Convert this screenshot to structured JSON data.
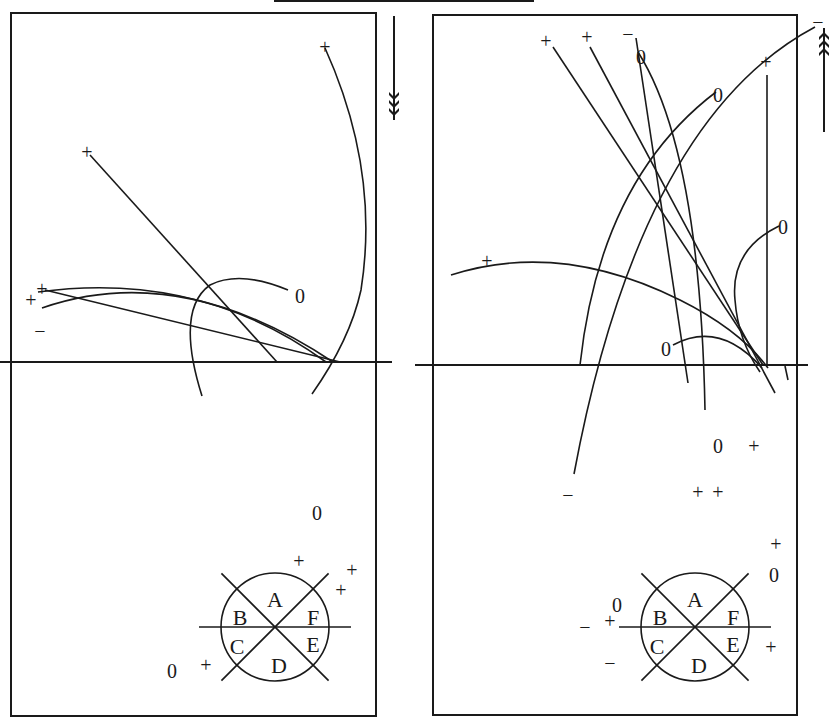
{
  "diagram": {
    "stroke_color": "#1a1a1a",
    "background": "#ffffff",
    "top_bar": {
      "x1": 274,
      "x2": 534,
      "y": 1
    },
    "panels": [
      {
        "id": "left",
        "frame": {
          "x": 11,
          "y": 13,
          "w": 365,
          "h": 703
        },
        "baseline": {
          "x1": 0,
          "x2": 392,
          "y": 362
        },
        "direction_arrow": {
          "x": 394,
          "y1": 16,
          "y2": 120,
          "direction": "down"
        },
        "traces": [
          {
            "d": "M 325 48 Q 380 170 361 290 Q 350 340 312 394"
          },
          {
            "d": "M 90 155 L 277 362"
          },
          {
            "d": "M 38 292 Q 200 270 326 362"
          },
          {
            "d": "M 42 308 Q 180 260 333 362"
          },
          {
            "d": "M 45 290 L 340 362"
          },
          {
            "d": "M 288 290 Q 240 270 210 285 Q 175 310 202 396"
          }
        ],
        "labels": [
          {
            "text": "+",
            "x": 325,
            "y": 48
          },
          {
            "text": "+",
            "x": 87,
            "y": 153
          },
          {
            "text": "+",
            "x": 42,
            "y": 290
          },
          {
            "text": "+",
            "x": 31,
            "y": 301
          },
          {
            "text": "−",
            "x": 40,
            "y": 332
          },
          {
            "text": "0",
            "x": 300,
            "y": 297
          },
          {
            "text": "0",
            "x": 317,
            "y": 514
          },
          {
            "text": "+",
            "x": 299,
            "y": 562
          },
          {
            "text": "+",
            "x": 352,
            "y": 571
          },
          {
            "text": "+",
            "x": 341,
            "y": 591
          },
          {
            "text": "0",
            "x": 172,
            "y": 672
          },
          {
            "text": "+",
            "x": 206,
            "y": 666
          }
        ],
        "sector_circle": {
          "cx": 275,
          "cy": 627,
          "r": 54,
          "sectors": [
            "A",
            "B",
            "C",
            "D",
            "E",
            "F"
          ]
        }
      },
      {
        "id": "right",
        "frame": {
          "x": 433,
          "y": 15,
          "w": 364,
          "h": 700
        },
        "baseline": {
          "x1": 415,
          "x2": 808,
          "y": 365
        },
        "direction_arrow": {
          "x": 824,
          "y1": 28,
          "y2": 132,
          "direction": "up"
        },
        "traces": [
          {
            "d": "M 553 47 L 763 365"
          },
          {
            "d": "M 590 47 L 775 393"
          },
          {
            "d": "M 636 38 L 688 383"
          },
          {
            "d": "M 638 52 Q 700 150 705 410"
          },
          {
            "d": "M 815 27 Q 640 120 574 474"
          },
          {
            "d": "M 716 92 Q 600 180 580 365"
          },
          {
            "d": "M 767 75 L 767 365"
          },
          {
            "d": "M 779 226 Q 730 250 735 300 Q 738 340 760 372"
          },
          {
            "d": "M 451 275 Q 560 240 680 300 Q 740 330 768 368"
          },
          {
            "d": "M 673 345 Q 720 320 762 368"
          },
          {
            "d": "M 785 366 L 788 380"
          }
        ],
        "labels": [
          {
            "text": "+",
            "x": 546,
            "y": 42
          },
          {
            "text": "+",
            "x": 587,
            "y": 38
          },
          {
            "text": "−",
            "x": 628,
            "y": 35
          },
          {
            "text": "0",
            "x": 641,
            "y": 58
          },
          {
            "text": "0",
            "x": 718,
            "y": 96
          },
          {
            "text": "+",
            "x": 766,
            "y": 63
          },
          {
            "text": "−",
            "x": 818,
            "y": 23
          },
          {
            "text": "0",
            "x": 783,
            "y": 228
          },
          {
            "text": "+",
            "x": 487,
            "y": 262
          },
          {
            "text": "0",
            "x": 666,
            "y": 350
          },
          {
            "text": "0",
            "x": 718,
            "y": 447
          },
          {
            "text": "+",
            "x": 754,
            "y": 447
          },
          {
            "text": "+",
            "x": 698,
            "y": 493
          },
          {
            "text": "+",
            "x": 718,
            "y": 493
          },
          {
            "text": "−",
            "x": 568,
            "y": 496
          },
          {
            "text": "+",
            "x": 776,
            "y": 545
          },
          {
            "text": "0",
            "x": 774,
            "y": 576
          },
          {
            "text": "0",
            "x": 617,
            "y": 606
          },
          {
            "text": "−",
            "x": 585,
            "y": 628
          },
          {
            "text": "+",
            "x": 610,
            "y": 622
          },
          {
            "text": "−",
            "x": 610,
            "y": 664
          },
          {
            "text": "+",
            "x": 771,
            "y": 648
          }
        ],
        "sector_circle": {
          "cx": 695,
          "cy": 627,
          "r": 54,
          "sectors": [
            "A",
            "B",
            "C",
            "D",
            "E",
            "F"
          ]
        }
      }
    ]
  }
}
